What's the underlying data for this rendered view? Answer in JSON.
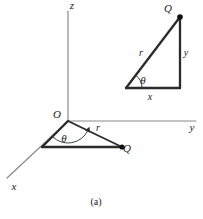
{
  "figure": {
    "caption": "(a)",
    "background_color": "#ffffff",
    "line_color": "#2b2b2b",
    "axis_color": "#8a8a8a",
    "text_color": "#1a1a1a",
    "axes": {
      "z": {
        "label": "z",
        "label_x": 72,
        "label_y": 9,
        "x1": 68,
        "y1": 11,
        "x2": 68,
        "y2": 121
      },
      "y": {
        "label": "y",
        "label_x": 192,
        "label_y": 131,
        "x1": 68,
        "y1": 121,
        "x2": 196,
        "y2": 121
      },
      "x": {
        "label": "x",
        "label_x": 14,
        "label_y": 190,
        "x1": 68,
        "y1": 121,
        "x2": 7,
        "y2": 178
      }
    },
    "origin": {
      "label": "O",
      "label_x": 57,
      "label_y": 118,
      "x": 68,
      "y": 121
    },
    "lower_triangle": {
      "name": "projection-triangle",
      "vertices": {
        "o_x": 68,
        "o_y": 121,
        "foot_x": 42,
        "foot_y": 147,
        "q_x": 122,
        "q_y": 147
      },
      "point_label": "Q",
      "point_label_x": 127,
      "point_label_y": 152,
      "hypotenuse_label": "r",
      "hypotenuse_label_x": 98,
      "hypotenuse_label_y": 131,
      "angle_label": "θ",
      "angle_label_x": 64,
      "angle_label_y": 142,
      "arc_radius": 22
    },
    "upper_triangle": {
      "name": "right-triangle-inset",
      "vertices": {
        "a_x": 126,
        "a_y": 88,
        "b_x": 180,
        "b_y": 88,
        "c_x": 180,
        "c_y": 17
      },
      "point_label": "Q",
      "point_label_x": 168,
      "point_label_y": 12,
      "hypotenuse_label": "r",
      "hypotenuse_label_x": 141,
      "hypotenuse_label_y": 56,
      "vertical_label": "y",
      "vertical_label_x": 186,
      "vertical_label_y": 56,
      "horizontal_label": "x",
      "horizontal_label_x": 150,
      "horizontal_label_y": 100,
      "angle_label": "θ",
      "angle_label_x": 143,
      "angle_label_y": 84,
      "arc_radius": 16
    },
    "caption_x": 96,
    "caption_y": 205
  }
}
